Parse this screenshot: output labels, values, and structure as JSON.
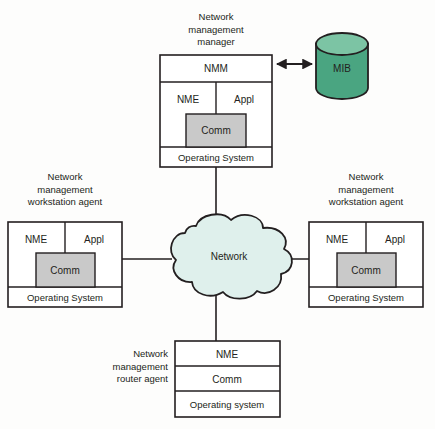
{
  "diagram": {
    "title_alt": "Network management architecture",
    "colors": {
      "stroke": "#231f20",
      "comm_fill": "#c9c9c9",
      "cloud_fill": "#dff0ec",
      "mib_body": "#4aa581",
      "mib_top": "#7cc4a4",
      "box_fill": "#ffffff",
      "text": "#231f20"
    }
  },
  "manager": {
    "label_lines": [
      "Network",
      "management",
      "manager"
    ],
    "nmm": "NMM",
    "nme": "NME",
    "appl": "Appl",
    "comm": "Comm",
    "os": "Operating System"
  },
  "mib": {
    "label": "MIB"
  },
  "network": {
    "label": "Network"
  },
  "left_agent": {
    "label_lines": [
      "Network",
      "management",
      "workstation agent"
    ],
    "nme": "NME",
    "appl": "Appl",
    "comm": "Comm",
    "os": "Operating System"
  },
  "right_agent": {
    "label_lines": [
      "Network",
      "management",
      "workstation agent"
    ],
    "nme": "NME",
    "appl": "Appl",
    "comm": "Comm",
    "os": "Operating System"
  },
  "router_agent": {
    "label_lines": [
      "Network",
      "management",
      "router agent"
    ],
    "nme": "NME",
    "comm": "Comm",
    "os": "Operating system"
  }
}
